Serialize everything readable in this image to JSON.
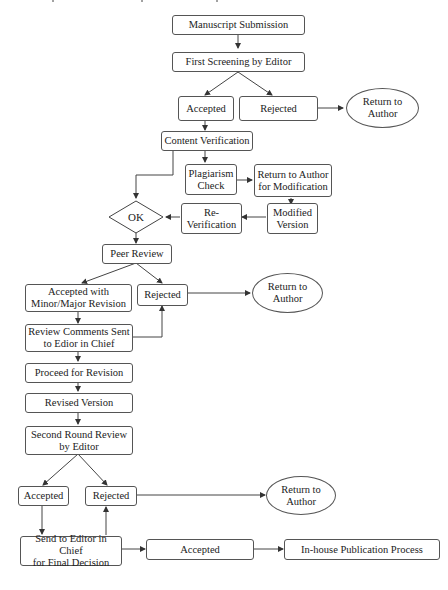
{
  "diagram": {
    "type": "flowchart",
    "nodes": {
      "submission": "Manuscript Submission",
      "first_screening": "First Screening by Editor",
      "accepted_1": "Accepted",
      "rejected_1": "Rejected",
      "return_author_1": "Return to Author",
      "content_verification": "Content Verification",
      "plagiarism_check": "Plagiarism Check",
      "return_for_modification": "Return to Author for Modification",
      "modified_version": "Modified Version",
      "re_verification": "Re-Verification",
      "ok_decision": "OK",
      "peer_review": "Peer Review",
      "accepted_revision": "Accepted with Minor/Major Revision",
      "rejected_2": "Rejected",
      "return_author_2": "Return to Author",
      "review_comments": "Review Comments Sent to Edior in Chief",
      "proceed_revision": "Proceed for Revision",
      "revised_version": "Revised Version",
      "second_round": "Second Round Review by Editor",
      "accepted_3": "Accepted",
      "rejected_3": "Rejected",
      "return_author_3": "Return to Author",
      "send_final": "Send to Editor in Chief for Final Decision",
      "accepted_final": "Accepted",
      "publication": "In-house Publication Process"
    },
    "labels": {
      "plagiarism_l1": "Plagiarism",
      "plagiarism_l2": "Check",
      "return_mod_l1": "Return to Author",
      "return_mod_l2": "for Modification",
      "modified_l1": "Modified",
      "modified_l2": "Version",
      "reverif_l1": "Re-",
      "reverif_l2": "Verification",
      "return_l1": "Return to",
      "return_l2": "Author",
      "acc_rev_l1": "Accepted with",
      "acc_rev_l2": "Minor/Major Revision",
      "review_l1": "Review Comments Sent",
      "review_l2": "to Edior in Chief",
      "second_l1": "Second Round Review",
      "second_l2": "by Editor",
      "send_l1": "Send to Editor in Chief",
      "send_l2": "for Final Decision"
    },
    "edges": [
      [
        "submission",
        "first_screening"
      ],
      [
        "first_screening",
        "accepted_1"
      ],
      [
        "first_screening",
        "rejected_1"
      ],
      [
        "rejected_1",
        "return_author_1"
      ],
      [
        "accepted_1",
        "content_verification"
      ],
      [
        "content_verification",
        "plagiarism_check"
      ],
      [
        "content_verification",
        "ok_decision"
      ],
      [
        "plagiarism_check",
        "return_for_modification"
      ],
      [
        "return_for_modification",
        "modified_version"
      ],
      [
        "modified_version",
        "re_verification"
      ],
      [
        "re_verification",
        "ok_decision"
      ],
      [
        "ok_decision",
        "peer_review"
      ],
      [
        "peer_review",
        "accepted_revision"
      ],
      [
        "peer_review",
        "rejected_2"
      ],
      [
        "rejected_2",
        "return_author_2"
      ],
      [
        "accepted_revision",
        "review_comments"
      ],
      [
        "review_comments",
        "rejected_2"
      ],
      [
        "review_comments",
        "proceed_revision"
      ],
      [
        "proceed_revision",
        "revised_version"
      ],
      [
        "revised_version",
        "second_round"
      ],
      [
        "second_round",
        "accepted_3"
      ],
      [
        "second_round",
        "rejected_3"
      ],
      [
        "rejected_3",
        "return_author_3"
      ],
      [
        "accepted_3",
        "send_final"
      ],
      [
        "send_final",
        "rejected_3"
      ],
      [
        "send_final",
        "accepted_final"
      ],
      [
        "accepted_final",
        "publication"
      ]
    ]
  }
}
